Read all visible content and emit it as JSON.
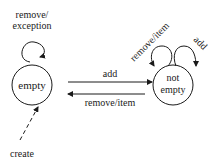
{
  "diagram": {
    "type": "state-machine",
    "states": [
      {
        "id": "empty",
        "label": "empty"
      },
      {
        "id": "not_empty",
        "label_line1": "not",
        "label_line2": "empty"
      }
    ],
    "transitions": [
      {
        "from": "empty",
        "to": "empty",
        "label_line1": "remove/",
        "label_line2": "exception"
      },
      {
        "from": "empty",
        "to": "not_empty",
        "label": "add"
      },
      {
        "from": "not_empty",
        "to": "empty",
        "label": "remove/item"
      },
      {
        "from": "not_empty",
        "to": "not_empty",
        "label": "remove/item"
      },
      {
        "from": "not_empty",
        "to": "not_empty",
        "label": "add"
      },
      {
        "from": "initial",
        "to": "empty",
        "label": "create",
        "style": "dashed"
      }
    ]
  }
}
